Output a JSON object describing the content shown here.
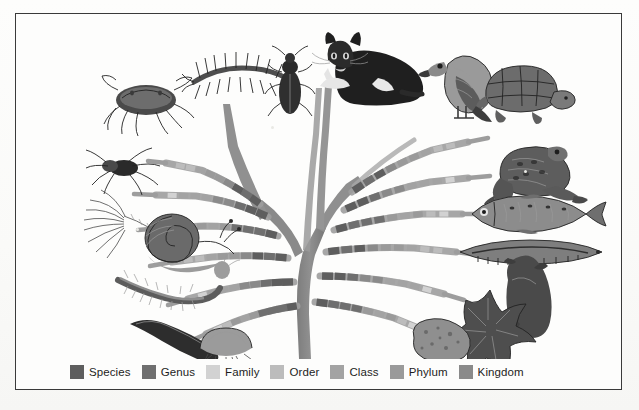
{
  "figure": {
    "background_color": "#fdfdfc",
    "frame_color": "#3a3a3a"
  },
  "legend": {
    "name": "taxonomic-rank-legend",
    "items": [
      {
        "label": "Species",
        "color": "#5e5e5e",
        "rank": 1
      },
      {
        "label": "Genus",
        "color": "#6f6f6f",
        "rank": 2
      },
      {
        "label": "Family",
        "color": "#d2d2d2",
        "rank": 3
      },
      {
        "label": "Order",
        "color": "#bcbcbc",
        "rank": 4
      },
      {
        "label": "Class",
        "color": "#a3a3a3",
        "rank": 5
      },
      {
        "label": "Phylum",
        "color": "#9a9a9a",
        "rank": 6
      },
      {
        "label": "Kingdom",
        "color": "#8a8a8a",
        "rank": 7
      }
    ]
  },
  "tree": {
    "name": "cladogram-tree",
    "trunk_color": "#8a8a8a",
    "trunk_color_dark": "#7b7b7b",
    "segment_palette": [
      "#d2d2d2",
      "#bcbcbc",
      "#a3a3a3",
      "#9a9a9a",
      "#8a8a8a",
      "#6f6f6f",
      "#5e5e5e"
    ],
    "branches": [
      {
        "side": "left",
        "index": 1,
        "organism": "crab"
      },
      {
        "side": "left",
        "index": 2,
        "organism": "spider"
      },
      {
        "side": "left",
        "index": 3,
        "organism": "feather-worm"
      },
      {
        "side": "left",
        "index": 4,
        "organism": "snail"
      },
      {
        "side": "left",
        "index": 5,
        "organism": "bristle-worm"
      },
      {
        "side": "left",
        "index": 6,
        "organism": "leech"
      },
      {
        "side": "left",
        "index": 7,
        "organism": "jellyfish"
      },
      {
        "side": "top-left",
        "index": 0,
        "organism": "centipede"
      },
      {
        "side": "top-left",
        "index": 0,
        "organism": "beetle"
      },
      {
        "side": "top",
        "index": 0,
        "organism": "cat"
      },
      {
        "side": "right",
        "index": 1,
        "organism": "bird"
      },
      {
        "side": "right",
        "index": 2,
        "organism": "tortoise"
      },
      {
        "side": "right",
        "index": 3,
        "organism": "frog"
      },
      {
        "side": "right",
        "index": 4,
        "organism": "fish"
      },
      {
        "side": "right",
        "index": 5,
        "organism": "lancelet"
      },
      {
        "side": "right",
        "index": 6,
        "organism": "sea-squirt"
      },
      {
        "side": "right",
        "index": 7,
        "organism": "starfish"
      },
      {
        "side": "right",
        "index": 8,
        "organism": "sponge"
      }
    ]
  },
  "organisms": {
    "crab": "crab",
    "spider": "spider",
    "feather_worm": "feather-duster-worm",
    "snail": "snail",
    "bristle_worm": "bristle-worm",
    "leech": "leech",
    "jellyfish": "jellyfish",
    "centipede": "centipede",
    "beetle": "beetle",
    "cat": "cat",
    "bird": "bird",
    "tortoise": "tortoise",
    "frog": "frog",
    "fish": "fish",
    "lancelet": "lancelet",
    "sea_squirt": "sea-squirt",
    "starfish": "starfish",
    "sponge": "sponge"
  }
}
